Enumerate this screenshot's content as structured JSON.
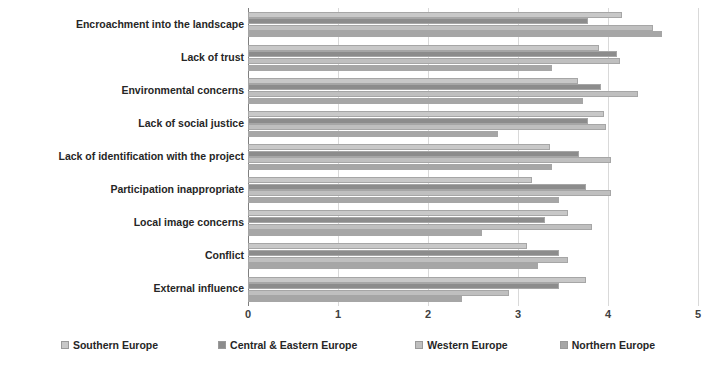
{
  "chart_data": {
    "type": "bar",
    "orientation": "horizontal",
    "title": "",
    "subtitle": "",
    "xlabel": "",
    "ylabel": "",
    "xlim": [
      0,
      5
    ],
    "xticks": [
      0,
      1,
      2,
      3,
      4,
      5
    ],
    "xtick_labels": [
      "0",
      "1",
      "2",
      "3",
      "4",
      "5"
    ],
    "grid": true,
    "grid_axis": "x",
    "legend_position": "bottom",
    "categories": [
      "Encroachment into the landscape",
      "Lack of  trust",
      "Environmental concerns",
      "Lack of social justice",
      "Lack of identification with the project",
      "Participation inappropriate",
      "Local image concerns",
      "Conflict",
      "External influence"
    ],
    "series": [
      {
        "name": "Southern Europe",
        "color": "#c8c8c8",
        "values": [
          4.15,
          3.9,
          3.67,
          3.95,
          3.35,
          3.15,
          3.55,
          3.1,
          3.75
        ]
      },
      {
        "name": "Central & Eastern Europe",
        "color": "#8c8c8c",
        "values": [
          3.78,
          4.1,
          3.92,
          3.78,
          3.68,
          3.75,
          3.3,
          3.45,
          3.45
        ]
      },
      {
        "name": "Western Europe",
        "color": "#bfbfbf",
        "values": [
          4.5,
          4.13,
          4.33,
          3.98,
          4.03,
          4.03,
          3.82,
          3.55,
          2.9
        ]
      },
      {
        "name": "Northern Europe",
        "color": "#a6a6a6",
        "values": [
          4.6,
          3.38,
          3.72,
          2.78,
          3.38,
          3.45,
          2.6,
          3.22,
          2.38
        ]
      }
    ]
  },
  "legend": {
    "items": [
      {
        "label": "Southern Europe",
        "color": "#c8c8c8"
      },
      {
        "label": "Central & Eastern Europe",
        "color": "#8c8c8c"
      },
      {
        "label": "Western Europe",
        "color": "#bfbfbf"
      },
      {
        "label": "Northern Europe",
        "color": "#a6a6a6"
      }
    ]
  }
}
